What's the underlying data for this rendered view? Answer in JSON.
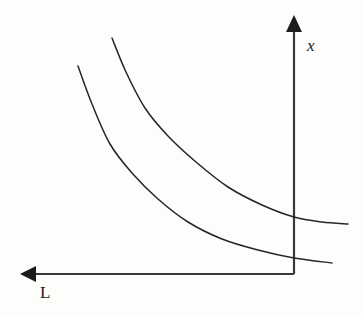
{
  "figure": {
    "background_color": "#fdfdfc",
    "line_color": "#262626",
    "axis_color": "#3a3a3a",
    "width": 363,
    "height": 317
  },
  "axes": {
    "vertical": {
      "label": "x",
      "label_style": "italic",
      "arrow_direction": "up",
      "x_position": 294,
      "top_y": 17,
      "bottom_y": 274,
      "arrow_name": "up-arrow-icon"
    },
    "horizontal": {
      "label": "L",
      "label_style": "normal",
      "arrow_direction": "left",
      "y_position": 274,
      "left_x": 22,
      "right_x": 294,
      "arrow_name": "left-arrow-icon"
    },
    "origin": {
      "x": 294,
      "y": 274
    }
  },
  "chart_data": {
    "type": "line",
    "title": "",
    "xlabel": "L",
    "ylabel": "x",
    "grid": false,
    "legend": "none",
    "axis_orientation": {
      "x_axis": "points left",
      "y_axis": "points up"
    },
    "series": [
      {
        "name": "upper-curve",
        "description": "Higher convex downward-sloping curve (outer isoquant)",
        "points": [
          [
            112,
            38
          ],
          [
            126,
            72
          ],
          [
            145,
            108
          ],
          [
            168,
            136
          ],
          [
            196,
            162
          ],
          [
            228,
            187
          ],
          [
            262,
            205
          ],
          [
            294,
            217
          ],
          [
            322,
            222
          ],
          [
            348,
            224
          ]
        ]
      },
      {
        "name": "lower-curve",
        "description": "Lower convex downward-sloping curve (inner isoquant)",
        "points": [
          [
            78,
            66
          ],
          [
            92,
            104
          ],
          [
            110,
            144
          ],
          [
            132,
            173
          ],
          [
            158,
            199
          ],
          [
            188,
            222
          ],
          [
            222,
            239
          ],
          [
            258,
            250
          ],
          [
            294,
            258
          ],
          [
            332,
            263
          ]
        ]
      }
    ]
  }
}
